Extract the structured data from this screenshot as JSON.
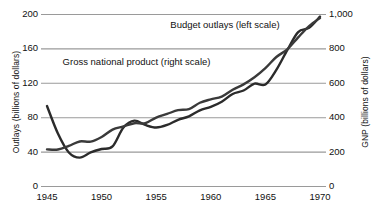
{
  "chart_data": {
    "type": "line",
    "title": "",
    "subtitle": "",
    "xlabel": "",
    "ylabel": "Outlays (billions of dollars)",
    "y2label": "GNP (billions of dollars)",
    "grid": true,
    "legend_position": "inline-annotations",
    "xlim": [
      1945,
      1970
    ],
    "ylim": [
      0,
      200
    ],
    "y2lim": [
      0,
      1000
    ],
    "x_ticks": [
      "1945",
      "1950",
      "1955",
      "1960",
      "1965",
      "1970"
    ],
    "x_tick_values": [
      1945,
      1950,
      1955,
      1960,
      1965,
      1970
    ],
    "y_ticks": [
      "0",
      "40",
      "80",
      "120",
      "160",
      "200"
    ],
    "y_tick_values": [
      0,
      40,
      80,
      120,
      160,
      200
    ],
    "y2_ticks": [
      "0",
      "200",
      "400",
      "600",
      "800",
      "1,000"
    ],
    "y2_tick_values": [
      0,
      200,
      400,
      600,
      800,
      1000
    ],
    "annotations": [
      {
        "text": "Budget outlays (left scale)",
        "x": 1961.3,
        "y": 186
      },
      {
        "text": "Gross national product (right scale)",
        "x": 1953.2,
        "y": 143
      }
    ],
    "series": [
      {
        "name": "Budget outlays (left scale)",
        "axis": "left",
        "color": "#2b2b2b",
        "x": [
          1945,
          1946,
          1947,
          1948,
          1949,
          1950,
          1951,
          1952,
          1953,
          1954,
          1955,
          1956,
          1957,
          1958,
          1959,
          1960,
          1961,
          1962,
          1963,
          1964,
          1965,
          1966,
          1967,
          1968,
          1969,
          1970
        ],
        "values": [
          93,
          61,
          39,
          33,
          39,
          43,
          46,
          68,
          76,
          71,
          68,
          71,
          77,
          81,
          88,
          92,
          98,
          107,
          111,
          119,
          118,
          135,
          158,
          179,
          184,
          197
        ]
      },
      {
        "name": "Gross national product (right scale)",
        "axis": "right",
        "color": "#3a3a3a",
        "x": [
          1945,
          1946,
          1947,
          1948,
          1949,
          1950,
          1951,
          1952,
          1953,
          1954,
          1955,
          1956,
          1957,
          1958,
          1959,
          1960,
          1961,
          1962,
          1963,
          1964,
          1965,
          1966,
          1967,
          1968,
          1969,
          1970
        ],
        "values": [
          213,
          212,
          233,
          259,
          258,
          285,
          328,
          346,
          365,
          365,
          398,
          419,
          441,
          447,
          484,
          504,
          520,
          560,
          591,
          632,
          685,
          750,
          794,
          864,
          930,
          977
        ]
      }
    ]
  }
}
